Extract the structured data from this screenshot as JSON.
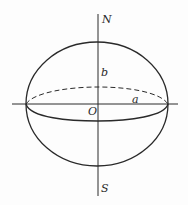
{
  "diagram": {
    "labels": {
      "north": "N",
      "south": "S",
      "origin": "O",
      "semi_major": "a",
      "semi_minor": "b"
    },
    "colors": {
      "stroke": "#2a2a2a",
      "background": "#fdfdfd"
    }
  }
}
